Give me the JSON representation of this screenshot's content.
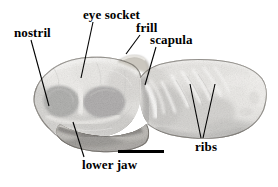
{
  "figure": {
    "type": "annotated-fossil-photograph",
    "background_color": "#ffffff",
    "label_color": "#000000",
    "width": 278,
    "height": 187
  },
  "labels": [
    {
      "id": "nostril",
      "text": "nostril"
    },
    {
      "id": "eye_socket",
      "text": "eye socket"
    },
    {
      "id": "frill",
      "text": "frill"
    },
    {
      "id": "scapula",
      "text": "scapula"
    },
    {
      "id": "ribs",
      "text": "ribs"
    },
    {
      "id": "lower_jaw",
      "text": "lower jaw"
    }
  ],
  "scale_bar": {
    "present": true,
    "caption": "",
    "color": "#000000"
  },
  "photo": {
    "palette": {
      "bone_light": "#d8d5cf",
      "bone_mid": "#a9a49c",
      "bone_dark": "#6d6962",
      "shadow": "#2b2926",
      "cavity": "#1a1917",
      "highlight": "#f0eee9"
    }
  }
}
